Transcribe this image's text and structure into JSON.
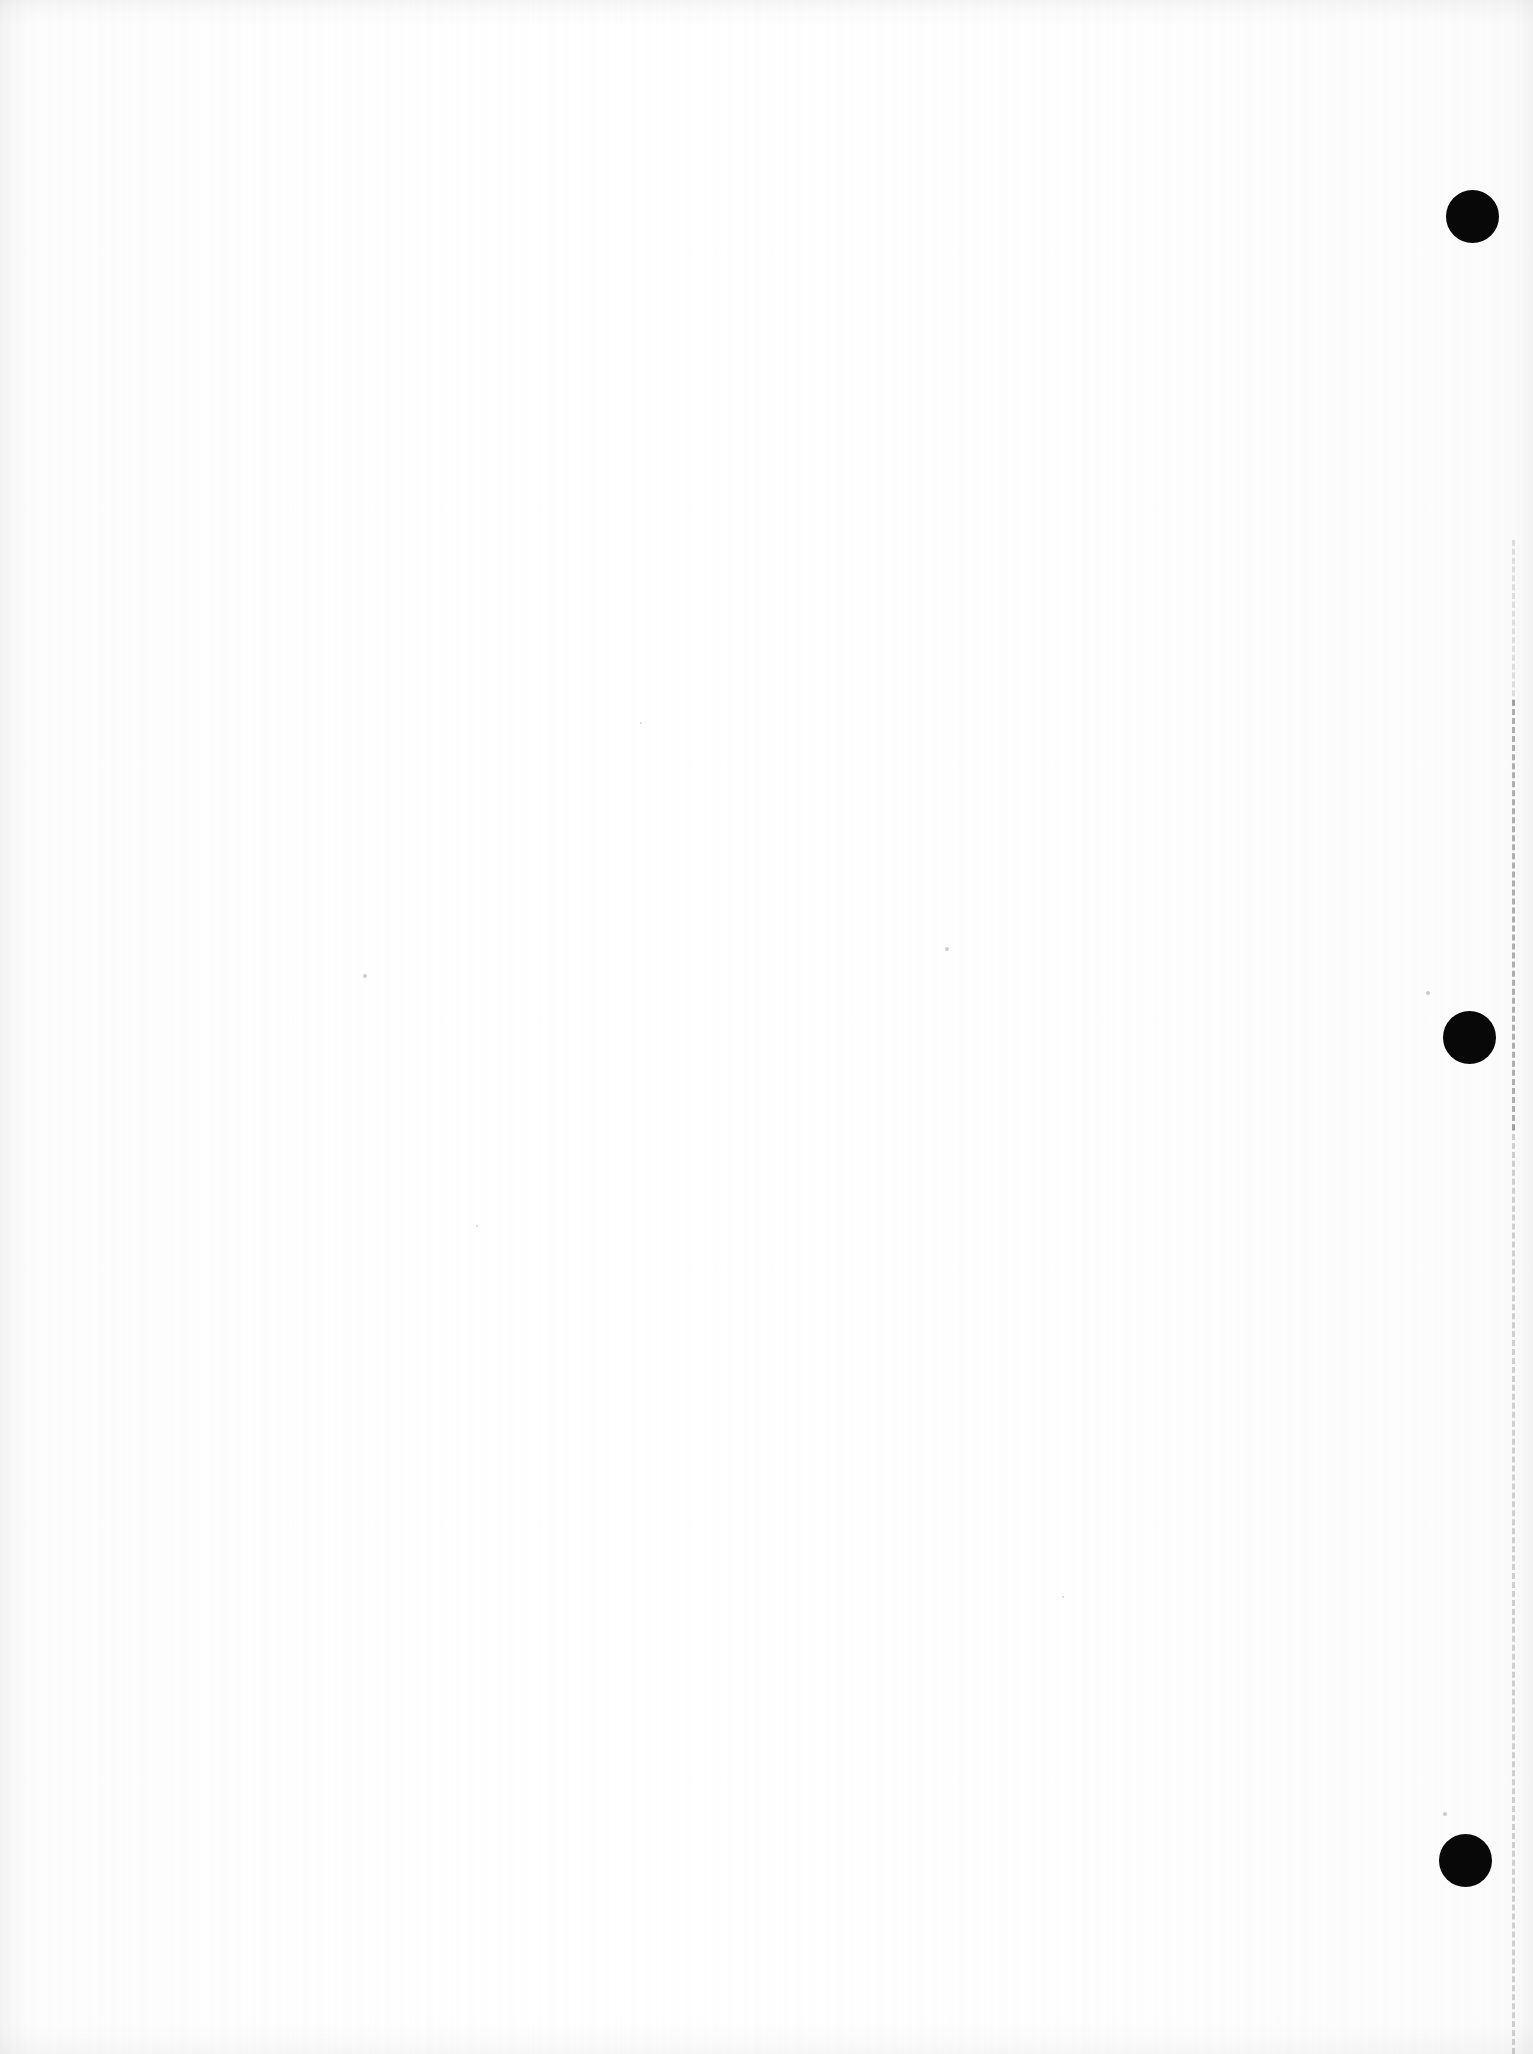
{
  "page": {
    "width_px": 1533,
    "height_px": 2054,
    "background_color": "#fdfdfd",
    "content_text": ""
  },
  "marks": {
    "registration_dots": [
      {
        "name": "registration-dot-top",
        "cx": 1472,
        "cy": 216,
        "d": 53,
        "color": "#080808"
      },
      {
        "name": "registration-dot-middle",
        "cx": 1469,
        "cy": 1037,
        "d": 53,
        "color": "#080808"
      },
      {
        "name": "registration-dot-bottom",
        "cx": 1465,
        "cy": 1860,
        "d": 53,
        "color": "#080808"
      }
    ],
    "dashed_rule": {
      "name": "dashed-margin-rule",
      "x": 1512,
      "y_start": 540,
      "y_end": 2054,
      "dash_color": "#6a6a70",
      "segments": [
        {
          "label": "faint-upper",
          "y": 540,
          "height": 165,
          "opacity": 0.22
        },
        {
          "label": "dark-middle",
          "y": 700,
          "height": 430,
          "opacity": 0.52
        },
        {
          "label": "light-lower",
          "y": 1125,
          "height": 929,
          "opacity": 0.34
        }
      ]
    },
    "specks": [
      {
        "x": 945,
        "y": 947,
        "r": 2
      },
      {
        "x": 363,
        "y": 974,
        "r": 2
      },
      {
        "x": 1426,
        "y": 991,
        "r": 2
      },
      {
        "x": 1443,
        "y": 1812,
        "r": 2
      },
      {
        "x": 640,
        "y": 722,
        "r": 1
      },
      {
        "x": 476,
        "y": 1225,
        "r": 1
      },
      {
        "x": 1062,
        "y": 1596,
        "r": 1
      }
    ]
  },
  "edges": {
    "top_shadow_label": "scanner-lead-in-shadow",
    "bottom_shadow_label": "scanner-trail-shadow",
    "left_shadow_label": "binding-edge-shadow",
    "right_shadow_label": "right-edge-shadow"
  }
}
